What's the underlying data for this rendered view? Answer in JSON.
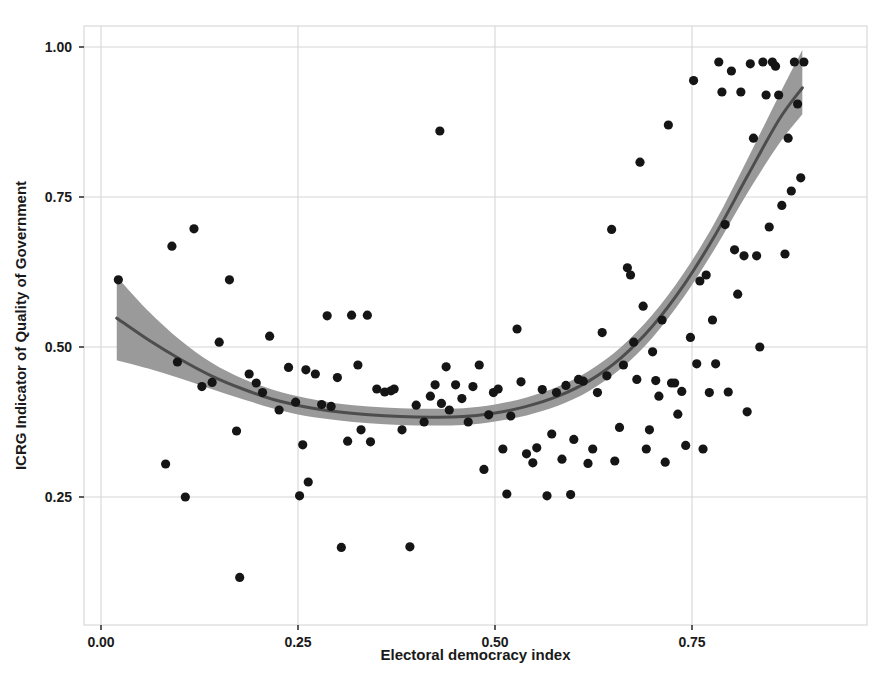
{
  "figure": {
    "title": "",
    "background_color": "#ffffff",
    "width": 893,
    "height": 682
  },
  "axes": {
    "x_title": "Electoral democracy index",
    "y_title": "ICRG Indicator of Quality of Government",
    "x_ticks": [
      "0.00",
      "0.25",
      "0.50",
      "0.75"
    ],
    "y_ticks": [
      "0.25",
      "0.50",
      "0.75",
      "1.00"
    ]
  },
  "style": {
    "point_color": "#151515",
    "line_color": "#4d4d4d",
    "ribbon_color": "#9a9a9a",
    "grid_color": "#d6d6d6",
    "panel_border_color": "#d9d9d9"
  },
  "chart_data": {
    "type": "scatter",
    "title": "",
    "xlabel": "Electoral democracy index",
    "ylabel": "ICRG Indicator of Quality of Government",
    "xlim": [
      -0.015,
      0.955
    ],
    "ylim": [
      0.075,
      1.045
    ],
    "xticks": [
      0.0,
      0.25,
      0.5,
      0.75
    ],
    "yticks": [
      0.25,
      0.5,
      0.75,
      1.0
    ],
    "grid": true,
    "legend": "none",
    "series": [
      {
        "name": "countries",
        "type": "scatter",
        "marker": "circle",
        "color": "#151515",
        "points": [
          [
            0.022,
            0.612
          ],
          [
            0.082,
            0.305
          ],
          [
            0.09,
            0.668
          ],
          [
            0.097,
            0.475
          ],
          [
            0.107,
            0.25
          ],
          [
            0.118,
            0.697
          ],
          [
            0.128,
            0.434
          ],
          [
            0.141,
            0.441
          ],
          [
            0.15,
            0.508
          ],
          [
            0.163,
            0.612
          ],
          [
            0.172,
            0.36
          ],
          [
            0.176,
            0.116
          ],
          [
            0.188,
            0.455
          ],
          [
            0.197,
            0.44
          ],
          [
            0.205,
            0.424
          ],
          [
            0.214,
            0.518
          ],
          [
            0.226,
            0.395
          ],
          [
            0.238,
            0.466
          ],
          [
            0.247,
            0.408
          ],
          [
            0.252,
            0.252
          ],
          [
            0.256,
            0.337
          ],
          [
            0.26,
            0.462
          ],
          [
            0.263,
            0.275
          ],
          [
            0.272,
            0.455
          ],
          [
            0.28,
            0.404
          ],
          [
            0.287,
            0.552
          ],
          [
            0.292,
            0.401
          ],
          [
            0.3,
            0.449
          ],
          [
            0.305,
            0.166
          ],
          [
            0.313,
            0.343
          ],
          [
            0.318,
            0.553
          ],
          [
            0.326,
            0.47
          ],
          [
            0.33,
            0.362
          ],
          [
            0.338,
            0.553
          ],
          [
            0.342,
            0.342
          ],
          [
            0.35,
            0.43
          ],
          [
            0.36,
            0.425
          ],
          [
            0.368,
            0.427
          ],
          [
            0.372,
            0.43
          ],
          [
            0.382,
            0.362
          ],
          [
            0.392,
            0.167
          ],
          [
            0.4,
            0.403
          ],
          [
            0.41,
            0.375
          ],
          [
            0.418,
            0.418
          ],
          [
            0.424,
            0.437
          ],
          [
            0.43,
            0.86
          ],
          [
            0.432,
            0.406
          ],
          [
            0.438,
            0.467
          ],
          [
            0.442,
            0.395
          ],
          [
            0.45,
            0.437
          ],
          [
            0.458,
            0.414
          ],
          [
            0.466,
            0.375
          ],
          [
            0.472,
            0.434
          ],
          [
            0.48,
            0.47
          ],
          [
            0.486,
            0.296
          ],
          [
            0.492,
            0.387
          ],
          [
            0.498,
            0.424
          ],
          [
            0.504,
            0.43
          ],
          [
            0.51,
            0.33
          ],
          [
            0.515,
            0.255
          ],
          [
            0.52,
            0.385
          ],
          [
            0.528,
            0.53
          ],
          [
            0.533,
            0.442
          ],
          [
            0.54,
            0.322
          ],
          [
            0.548,
            0.307
          ],
          [
            0.553,
            0.332
          ],
          [
            0.56,
            0.429
          ],
          [
            0.566,
            0.252
          ],
          [
            0.572,
            0.355
          ],
          [
            0.578,
            0.424
          ],
          [
            0.585,
            0.313
          ],
          [
            0.59,
            0.436
          ],
          [
            0.596,
            0.254
          ],
          [
            0.6,
            0.346
          ],
          [
            0.606,
            0.446
          ],
          [
            0.612,
            0.443
          ],
          [
            0.618,
            0.306
          ],
          [
            0.624,
            0.33
          ],
          [
            0.63,
            0.424
          ],
          [
            0.636,
            0.524
          ],
          [
            0.642,
            0.452
          ],
          [
            0.648,
            0.696
          ],
          [
            0.652,
            0.31
          ],
          [
            0.658,
            0.366
          ],
          [
            0.663,
            0.47
          ],
          [
            0.668,
            0.632
          ],
          [
            0.672,
            0.62
          ],
          [
            0.676,
            0.508
          ],
          [
            0.68,
            0.446
          ],
          [
            0.684,
            0.808
          ],
          [
            0.688,
            0.568
          ],
          [
            0.692,
            0.33
          ],
          [
            0.696,
            0.362
          ],
          [
            0.7,
            0.492
          ],
          [
            0.704,
            0.444
          ],
          [
            0.708,
            0.418
          ],
          [
            0.712,
            0.545
          ],
          [
            0.716,
            0.308
          ],
          [
            0.72,
            0.87
          ],
          [
            0.724,
            0.44
          ],
          [
            0.728,
            0.44
          ],
          [
            0.732,
            0.388
          ],
          [
            0.737,
            0.426
          ],
          [
            0.742,
            0.336
          ],
          [
            0.748,
            0.516
          ],
          [
            0.752,
            0.944
          ],
          [
            0.756,
            0.472
          ],
          [
            0.76,
            0.61
          ],
          [
            0.764,
            0.33
          ],
          [
            0.768,
            0.62
          ],
          [
            0.772,
            0.424
          ],
          [
            0.776,
            0.545
          ],
          [
            0.78,
            0.472
          ],
          [
            0.784,
            0.975
          ],
          [
            0.788,
            0.925
          ],
          [
            0.792,
            0.704
          ],
          [
            0.796,
            0.425
          ],
          [
            0.8,
            0.96
          ],
          [
            0.804,
            0.662
          ],
          [
            0.808,
            0.588
          ],
          [
            0.812,
            0.925
          ],
          [
            0.816,
            0.652
          ],
          [
            0.82,
            0.392
          ],
          [
            0.824,
            0.972
          ],
          [
            0.828,
            0.848
          ],
          [
            0.832,
            0.652
          ],
          [
            0.836,
            0.5
          ],
          [
            0.84,
            0.975
          ],
          [
            0.844,
            0.92
          ],
          [
            0.848,
            0.7
          ],
          [
            0.852,
            0.975
          ],
          [
            0.856,
            0.968
          ],
          [
            0.86,
            0.92
          ],
          [
            0.864,
            0.736
          ],
          [
            0.868,
            0.655
          ],
          [
            0.872,
            0.848
          ],
          [
            0.876,
            0.76
          ],
          [
            0.88,
            0.975
          ],
          [
            0.884,
            0.905
          ],
          [
            0.888,
            0.782
          ],
          [
            0.892,
            0.975
          ]
        ]
      }
    ],
    "fit": {
      "name": "loess-fit",
      "type": "line",
      "color": "#4d4d4d",
      "points": [
        [
          0.02,
          0.548
        ],
        [
          0.06,
          0.512
        ],
        [
          0.1,
          0.48
        ],
        [
          0.14,
          0.452
        ],
        [
          0.18,
          0.43
        ],
        [
          0.22,
          0.412
        ],
        [
          0.26,
          0.4
        ],
        [
          0.3,
          0.392
        ],
        [
          0.34,
          0.387
        ],
        [
          0.38,
          0.384
        ],
        [
          0.42,
          0.383
        ],
        [
          0.46,
          0.384
        ],
        [
          0.5,
          0.39
        ],
        [
          0.54,
          0.401
        ],
        [
          0.58,
          0.418
        ],
        [
          0.62,
          0.444
        ],
        [
          0.66,
          0.482
        ],
        [
          0.7,
          0.535
        ],
        [
          0.74,
          0.604
        ],
        [
          0.78,
          0.688
        ],
        [
          0.82,
          0.784
        ],
        [
          0.86,
          0.878
        ],
        [
          0.89,
          0.932
        ]
      ],
      "ribbon_upper": [
        [
          0.02,
          0.617
        ],
        [
          0.06,
          0.56
        ],
        [
          0.1,
          0.512
        ],
        [
          0.14,
          0.474
        ],
        [
          0.18,
          0.447
        ],
        [
          0.22,
          0.428
        ],
        [
          0.26,
          0.415
        ],
        [
          0.3,
          0.406
        ],
        [
          0.34,
          0.401
        ],
        [
          0.38,
          0.398
        ],
        [
          0.42,
          0.397
        ],
        [
          0.46,
          0.398
        ],
        [
          0.5,
          0.404
        ],
        [
          0.54,
          0.416
        ],
        [
          0.58,
          0.434
        ],
        [
          0.62,
          0.461
        ],
        [
          0.66,
          0.5
        ],
        [
          0.7,
          0.554
        ],
        [
          0.74,
          0.624
        ],
        [
          0.78,
          0.71
        ],
        [
          0.82,
          0.812
        ],
        [
          0.86,
          0.918
        ],
        [
          0.89,
          0.995
        ]
      ],
      "ribbon_lower": [
        [
          0.02,
          0.478
        ],
        [
          0.06,
          0.464
        ],
        [
          0.1,
          0.448
        ],
        [
          0.14,
          0.43
        ],
        [
          0.18,
          0.413
        ],
        [
          0.22,
          0.397
        ],
        [
          0.26,
          0.385
        ],
        [
          0.3,
          0.378
        ],
        [
          0.34,
          0.373
        ],
        [
          0.38,
          0.37
        ],
        [
          0.42,
          0.369
        ],
        [
          0.46,
          0.37
        ],
        [
          0.5,
          0.376
        ],
        [
          0.54,
          0.386
        ],
        [
          0.58,
          0.402
        ],
        [
          0.62,
          0.427
        ],
        [
          0.66,
          0.464
        ],
        [
          0.7,
          0.516
        ],
        [
          0.74,
          0.584
        ],
        [
          0.78,
          0.666
        ],
        [
          0.82,
          0.756
        ],
        [
          0.86,
          0.838
        ],
        [
          0.89,
          0.888
        ]
      ]
    }
  }
}
